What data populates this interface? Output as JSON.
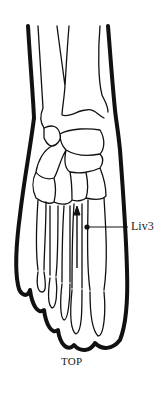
{
  "figure": {
    "point": {
      "label": "Liv3",
      "marker": "dot",
      "color": "#111111"
    },
    "view_label": "TOP",
    "arrow": "up-arrow"
  },
  "colors": {
    "outline": "#111111",
    "background": "#ffffff"
  }
}
